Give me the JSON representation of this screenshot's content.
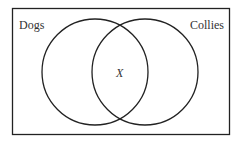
{
  "diagram": {
    "type": "venn",
    "sets": [
      {
        "label": "Dogs"
      },
      {
        "label": "Collies"
      }
    ],
    "intersection_label": "X",
    "colors": {
      "stroke": "#222222",
      "text": "#333333",
      "background": "#ffffff"
    }
  }
}
